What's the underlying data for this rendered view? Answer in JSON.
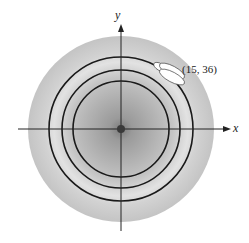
{
  "diagram": {
    "axes": {
      "x_label": "x",
      "y_label": "y"
    },
    "point_label": "(15, 36)",
    "contours": {
      "count": 3,
      "description": "concentric circular level curves"
    },
    "colors": {
      "background_disc": "#c8c8c8",
      "center_shade": "#8e8e8e",
      "contour_stroke": "#1a1a1a",
      "axis_stroke": "#222222",
      "highlight": "#ffffff"
    }
  }
}
